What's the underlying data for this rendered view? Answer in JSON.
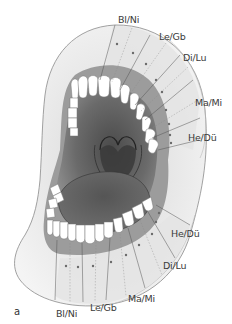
{
  "figure": {
    "panel_label": "a",
    "upper_jaw_labels": [
      {
        "text": "Bl/Ni",
        "x": 118,
        "y": 15
      },
      {
        "text": "Le/Gb",
        "x": 159,
        "y": 32
      },
      {
        "text": "Di/Lu",
        "x": 183,
        "y": 53
      },
      {
        "text": "Ma/Mi",
        "x": 195,
        "y": 98
      },
      {
        "text": "He/Dü",
        "x": 188,
        "y": 133
      }
    ],
    "lower_jaw_labels": [
      {
        "text": "He/Dü",
        "x": 171,
        "y": 229
      },
      {
        "text": "Di/Lu",
        "x": 163,
        "y": 261
      },
      {
        "text": "Ma/Mi",
        "x": 128,
        "y": 294
      },
      {
        "text": "Le/Gb",
        "x": 90,
        "y": 303
      },
      {
        "text": "Bl/Ni",
        "x": 56,
        "y": 309
      }
    ],
    "colors": {
      "outline": "#8a8a8a",
      "skin_fill": "#ececec",
      "zone_fill": "#e2e2e2",
      "gum": "#9a9a9a",
      "oral_cavity": "#6b6b6b",
      "tongue": "#5e5e5e",
      "teeth": "#ffffff",
      "dots": "#6a6a6a",
      "text": "#3a3a3a"
    }
  }
}
